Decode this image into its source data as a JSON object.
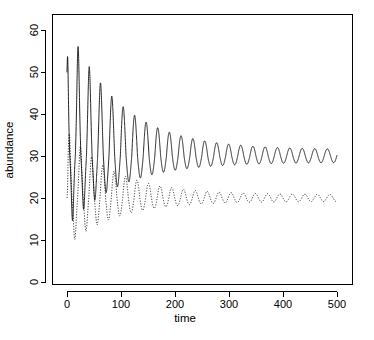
{
  "chart_data": {
    "type": "line",
    "title": "",
    "xlabel": "time",
    "ylabel": "abundance",
    "xlim": [
      -14,
      522
    ],
    "ylim": [
      0,
      62.5
    ],
    "xticks": [
      0,
      100,
      200,
      300,
      400,
      500
    ],
    "xtick_labels": [
      "0",
      "100",
      "200",
      "300",
      "400",
      "500"
    ],
    "yticks": [
      0,
      10,
      20,
      30,
      40,
      50,
      60
    ],
    "ytick_labels": [
      "0",
      "10",
      "20",
      "30",
      "40",
      "50",
      "60"
    ],
    "grid": false,
    "legend": "none",
    "frame": "box",
    "series": [
      {
        "name": "prey",
        "style": "solid",
        "color": "#000000",
        "start_value": 50,
        "equilibrium": 30,
        "initial_peak": 62,
        "initial_trough": 13,
        "final_peak": 31.5,
        "final_trough": 28.5,
        "decay_constant": 0.0105,
        "period_start": 20.5,
        "period_end": 23.5,
        "spike_sharpness": 2.6
      },
      {
        "name": "predator",
        "style": "dotted",
        "color": "#000000",
        "start_value": 20,
        "equilibrium": 20,
        "initial_peak": 36,
        "initial_trough": 8.5,
        "final_peak": 20.8,
        "final_trough": 19.2,
        "decay_constant": 0.0115,
        "period_start": 20.5,
        "period_end": 23.5,
        "phase_lag": 4.2,
        "spike_sharpness": 2.2
      }
    ]
  },
  "axes": {
    "x_title": "time",
    "y_title": "abundance"
  }
}
